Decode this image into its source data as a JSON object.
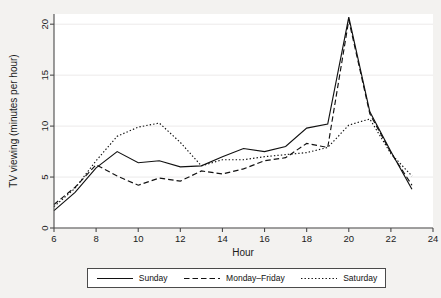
{
  "chart_data": {
    "type": "line",
    "title": "",
    "xlabel": "Hour",
    "ylabel": "TV viewing (minutes per hour)",
    "xlim": [
      6,
      24
    ],
    "ylim": [
      0,
      21
    ],
    "xticks": [
      6,
      8,
      10,
      12,
      14,
      16,
      18,
      20,
      22,
      24
    ],
    "yticks": [
      0,
      5,
      10,
      15,
      20
    ],
    "grid": "horizontal",
    "legend_position": "bottom-outside",
    "x": [
      6,
      7,
      8,
      9,
      10,
      11,
      12,
      13,
      14,
      15,
      16,
      17,
      18,
      19,
      20,
      21,
      22,
      23
    ],
    "series": [
      {
        "name": "Sunday",
        "style": "solid",
        "values": [
          1.7,
          3.5,
          5.9,
          7.5,
          6.4,
          6.6,
          6.0,
          6.1,
          7.0,
          7.8,
          7.5,
          8.0,
          9.8,
          10.2,
          20.7,
          11.4,
          7.5,
          3.8
        ]
      },
      {
        "name": "Monday-Friday",
        "style": "dashed",
        "values": [
          2.3,
          4.0,
          6.2,
          5.1,
          4.2,
          4.9,
          4.6,
          5.6,
          5.3,
          5.8,
          6.6,
          6.9,
          8.3,
          7.9,
          20.4,
          11.2,
          7.4,
          4.2
        ]
      },
      {
        "name": "Saturday",
        "style": "dotted",
        "values": [
          2.1,
          3.9,
          6.6,
          9.0,
          9.9,
          10.3,
          8.4,
          6.1,
          6.7,
          6.7,
          7.0,
          7.2,
          7.4,
          7.9,
          10.1,
          10.7,
          7.3,
          5.1
        ]
      }
    ]
  },
  "legend": {
    "entries": [
      {
        "label": "Sunday"
      },
      {
        "label": "Monday–Friday"
      },
      {
        "label": "Saturday"
      }
    ]
  },
  "colors": {
    "line": "#111111",
    "axis": "#4a4a4a",
    "grid": "#eceaea",
    "plot_background": "#ffffff",
    "figure_background": "#f3f2f0"
  }
}
